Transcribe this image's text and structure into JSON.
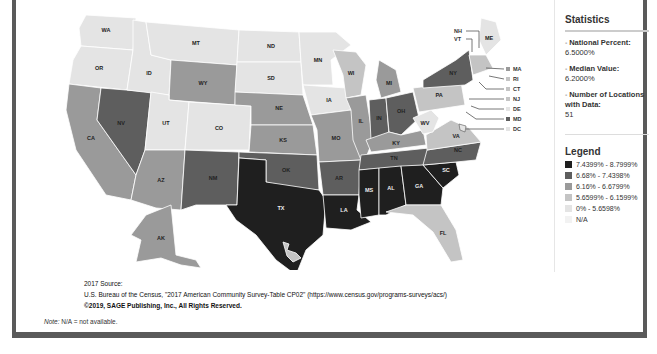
{
  "sidebar": {
    "statistics_title": "Statistics",
    "stats": [
      {
        "label": "National Percent:",
        "value": "6.5000%"
      },
      {
        "label": "Median Value:",
        "value": "6.2000%"
      },
      {
        "label": "Number of Locations with Data:",
        "value": "51"
      }
    ],
    "legend_title": "Legend",
    "legend": [
      {
        "label": "7.4399% - 8.7999%",
        "color": "#1f1f1f"
      },
      {
        "label": "6.68% - 7.4398%",
        "color": "#5e5e5e"
      },
      {
        "label": "6.16% - 6.6799%",
        "color": "#9a9a9a"
      },
      {
        "label": "5.6599% - 6.1599%",
        "color": "#c4c4c4"
      },
      {
        "label": "0% - 5.6598%",
        "color": "#e4e4e4"
      },
      {
        "label": "N/A",
        "color": "#f2f2f2"
      }
    ]
  },
  "source": {
    "year_line": "2017 Source:",
    "citation": "U.S. Bureau of the Census, \"2017 American Community Survey-Table CP02\" (https://www.census.gov/programs-surveys/acs/)",
    "copyright": "©2019, SAGE Publishing, Inc., All Rights Reserved."
  },
  "note": {
    "label": "Note:",
    "text": " N/A = not available."
  },
  "map": {
    "callouts": [
      "NH",
      "VT",
      "MA",
      "RI",
      "CT",
      "NJ",
      "DE",
      "MD",
      "DC"
    ],
    "states": {
      "WA": "lightest",
      "OR": "lightest",
      "ID": "lightest",
      "MT": "lightest",
      "ND": "lightest",
      "SD": "lightest",
      "MN": "lightest",
      "WY": "mid",
      "UT": "lightest",
      "CO": "lightest",
      "NE": "mid",
      "KS": "mid",
      "IA": "lightest",
      "WI": "light",
      "CA": "mid",
      "NV": "dark",
      "AZ": "mid",
      "NM": "dark",
      "OK": "dark",
      "TX": "darkest",
      "LA": "darkest",
      "MS": "darkest",
      "AL": "darkest",
      "GA": "darkest",
      "SC": "darkest",
      "FL": "light",
      "AR": "dark",
      "MO": "mid",
      "IL": "mid",
      "IN": "dark",
      "OH": "dark",
      "MI": "mid",
      "KY": "mid",
      "TN": "dark",
      "NC": "dark",
      "VA": "light",
      "WV": "lightest",
      "PA": "light",
      "NY": "dark",
      "ME": "lightest",
      "AK": "mid",
      "HI": "light"
    }
  }
}
